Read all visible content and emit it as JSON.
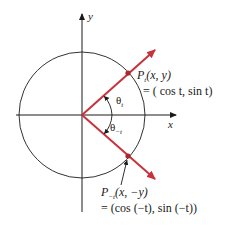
{
  "diagram": {
    "axes": {
      "x_label": "x",
      "y_label": "y"
    },
    "angles": {
      "theta_t": {
        "symbol": "θ",
        "subscript": "t"
      },
      "theta_neg_t": {
        "symbol": "θ",
        "subscript": "−t"
      }
    },
    "points": {
      "p_t": {
        "name": "P",
        "subscript": "t",
        "coords": "(x, y)",
        "equation": "= ( cos t, sin t)"
      },
      "p_neg_t": {
        "name": "P",
        "subscript": "−t",
        "coords": "(x, −y)",
        "equation": "= (cos (−t), sin (−t))"
      }
    },
    "colors": {
      "ray": "#c8323c",
      "point": "#a8282f",
      "axis": "#1a1a1a",
      "circle": "#333333"
    }
  }
}
